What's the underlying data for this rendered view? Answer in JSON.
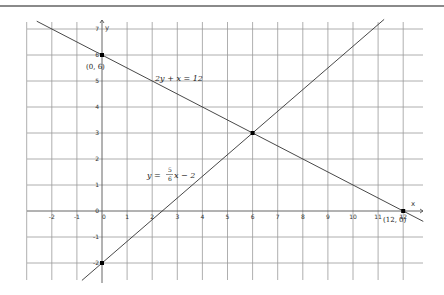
{
  "chart_data": {
    "type": "line",
    "title": "",
    "xlabel": "x",
    "ylabel": "y",
    "xlim": [
      -3,
      12.8
    ],
    "ylim": [
      -2.7,
      7.3
    ],
    "grid": true,
    "x_ticks": [
      -2,
      -1,
      0,
      1,
      2,
      3,
      4,
      5,
      6,
      7,
      8,
      9,
      10,
      11,
      12
    ],
    "y_ticks": [
      -2,
      -1,
      0,
      1,
      2,
      3,
      4,
      5,
      6,
      7
    ],
    "x_tick_labels": [
      "-2",
      "-1",
      "0",
      "1",
      "2",
      "3",
      "4",
      "5",
      "6",
      "7",
      "8",
      "9",
      "10",
      "11",
      "12"
    ],
    "y_tick_labels": [
      "-2",
      "-1",
      "0",
      "1",
      "2",
      "3",
      "4",
      "5",
      "6",
      "7"
    ],
    "series": [
      {
        "name": "2y + x = 12",
        "equation": "y = -x/2 + 6",
        "x": [
          -2.6,
          12.8
        ],
        "y": [
          7.3,
          -0.4
        ]
      },
      {
        "name": "y = 5/6 x − 2",
        "equation": "y = (5/6)x - 2",
        "x": [
          -0.8,
          11.24
        ],
        "y": [
          -2.67,
          7.37
        ]
      }
    ],
    "points": [
      {
        "x": 0,
        "y": 6,
        "label": "(0, 6)"
      },
      {
        "x": 12,
        "y": 0,
        "label": "(12, 0)"
      },
      {
        "x": 6,
        "y": 3,
        "label": ""
      },
      {
        "x": 0,
        "y": -2,
        "label": ""
      }
    ],
    "annotations": [
      {
        "text": "2y + x = 12",
        "x": 2.2,
        "y": 5.05
      },
      {
        "text": "y = 5/6 x − 2",
        "x": 1.7,
        "y": 1.3
      }
    ]
  },
  "labels": {
    "eq1": "2y + x = 12",
    "eq2_lhs": "y =",
    "eq2_num": "5",
    "eq2_den": "6",
    "eq2_rhs": "x − 2",
    "pt_0_6": "(0, 6)",
    "pt_12_0": "(12, 0)",
    "axis_x": "x",
    "axis_y": "y",
    "origin": "0"
  }
}
